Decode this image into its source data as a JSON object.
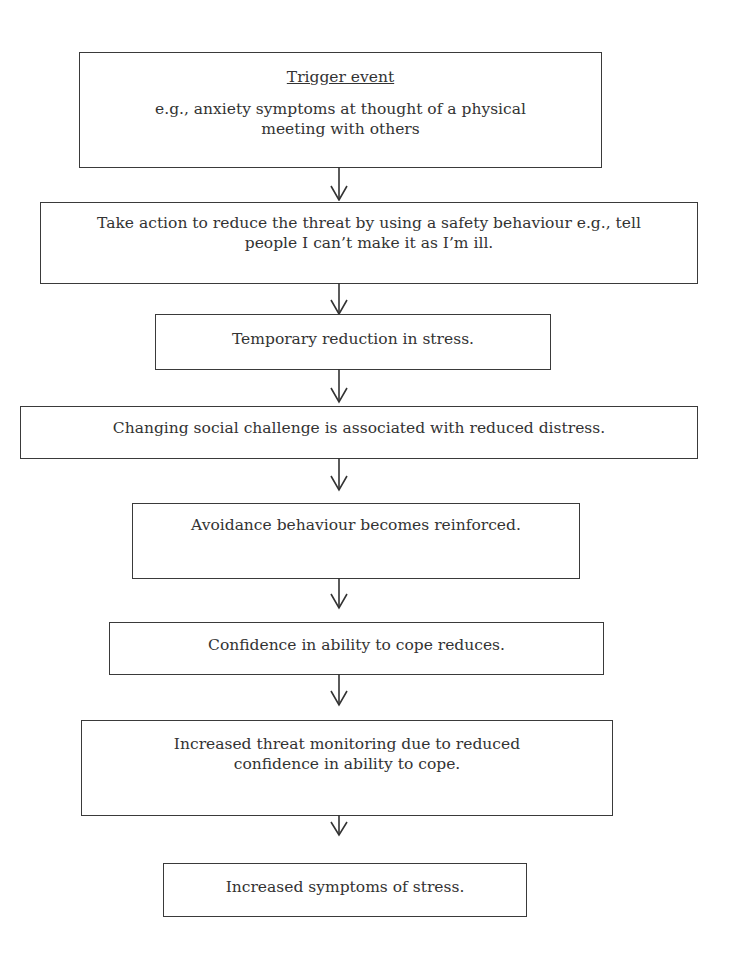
{
  "diagram": {
    "type": "flowchart",
    "direction": "top-to-bottom",
    "colors": {
      "background": "#ffffff",
      "border": "#3a3a3a",
      "text": "#333333"
    },
    "nodes": [
      {
        "id": "n1",
        "title": "Trigger event",
        "text": "e.g., anxiety symptoms at thought of a physical meeting with others",
        "lines": [
          "e.g., anxiety symptoms at thought of a physical",
          "meeting with others"
        ]
      },
      {
        "id": "n2",
        "text": "Take action to reduce the threat by using a safety behaviour e.g., tell people I can’t make it as I’m ill.",
        "lines": [
          "Take action to reduce the threat by using a safety behaviour e.g., tell",
          "people I can’t make it as I’m ill."
        ]
      },
      {
        "id": "n3",
        "text": "Temporary reduction in stress.",
        "lines": [
          "Temporary reduction in stress."
        ]
      },
      {
        "id": "n4",
        "text": "Changing social challenge is associated with reduced distress.",
        "lines": [
          "Changing social challenge is associated with reduced distress."
        ]
      },
      {
        "id": "n5",
        "text": "Avoidance behaviour becomes reinforced.",
        "lines": [
          "Avoidance behaviour becomes reinforced."
        ]
      },
      {
        "id": "n6",
        "text": "Confidence in ability to cope reduces.",
        "lines": [
          "Confidence in ability to cope reduces."
        ]
      },
      {
        "id": "n7",
        "text": "Increased threat monitoring due to reduced confidence in ability to cope.",
        "lines": [
          "Increased threat monitoring due to reduced",
          "confidence in ability to cope."
        ]
      },
      {
        "id": "n8",
        "text": "Increased symptoms of stress.",
        "lines": [
          "Increased symptoms of stress."
        ]
      }
    ],
    "edges": [
      {
        "from": "n1",
        "to": "n2",
        "icon": "arrow-down-icon"
      },
      {
        "from": "n2",
        "to": "n3",
        "icon": "arrow-down-icon"
      },
      {
        "from": "n3",
        "to": "n4",
        "icon": "arrow-down-icon"
      },
      {
        "from": "n4",
        "to": "n5",
        "icon": "arrow-down-icon"
      },
      {
        "from": "n5",
        "to": "n6",
        "icon": "arrow-down-icon"
      },
      {
        "from": "n6",
        "to": "n7",
        "icon": "arrow-down-icon"
      },
      {
        "from": "n7",
        "to": "n8",
        "icon": "arrow-down-icon"
      }
    ]
  }
}
